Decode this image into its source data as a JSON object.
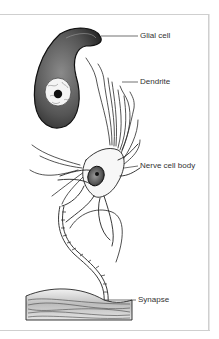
{
  "diagram": {
    "labels": {
      "glial_cell": "Glial cell",
      "dendrite": "Dendrite",
      "nerve_cell_body": "Nerve cell body",
      "synapse": "Synapse"
    },
    "colors": {
      "ink": "#1a1a1a",
      "glial_fill": "#5a5a5a",
      "frame": "#cfcfcf",
      "label_text": "#333333"
    }
  }
}
